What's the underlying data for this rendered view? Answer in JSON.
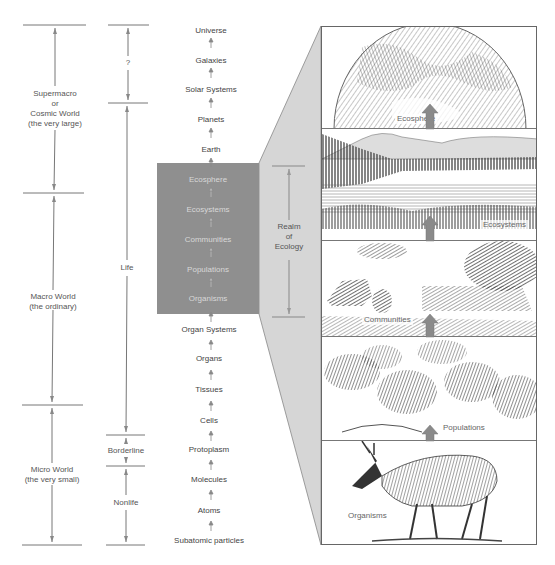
{
  "scale_columns": {
    "worlds": [
      {
        "label": "Supermacro\nor\nCosmic World\n(the very large)",
        "lines": [
          "Supermacro",
          "or",
          "Cosmic World",
          "(the very large)"
        ]
      },
      {
        "label": "Macro World\n(the ordinary)",
        "lines": [
          "Macro World",
          "(the ordinary)"
        ]
      },
      {
        "label": "Micro World\n(the very small)",
        "lines": [
          "Micro World",
          "(the very small)"
        ]
      }
    ],
    "life": [
      {
        "label": "?"
      },
      {
        "label": "Life"
      },
      {
        "label": "Borderline"
      },
      {
        "label": "Nonlife"
      }
    ]
  },
  "hierarchy": {
    "levels": [
      "Universe",
      "Galaxies",
      "Solar Systems",
      "Planets",
      "Earth",
      "Ecosphere",
      "Ecosystems",
      "Communities",
      "Populations",
      "Organisms",
      "Organ Systems",
      "Organs",
      "Tissues",
      "Cells",
      "Protoplasm",
      "Molecules",
      "Atoms",
      "Subatomic particles"
    ],
    "highlighted": [
      "Ecosphere",
      "Ecosystems",
      "Communities",
      "Populations",
      "Organisms"
    ]
  },
  "realm": {
    "lines": [
      "Realm",
      "of",
      "Ecology"
    ]
  },
  "panels": [
    {
      "label": "Ecosphere"
    },
    {
      "label": "Ecosystems"
    },
    {
      "label": "Communities"
    },
    {
      "label": "Populations"
    },
    {
      "label": "Organisms"
    }
  ],
  "colors": {
    "highlight_box": "#8f8f8f",
    "wedge": "#d6d6d6",
    "lines": "#777777",
    "arrow": "#8a8a8a"
  }
}
